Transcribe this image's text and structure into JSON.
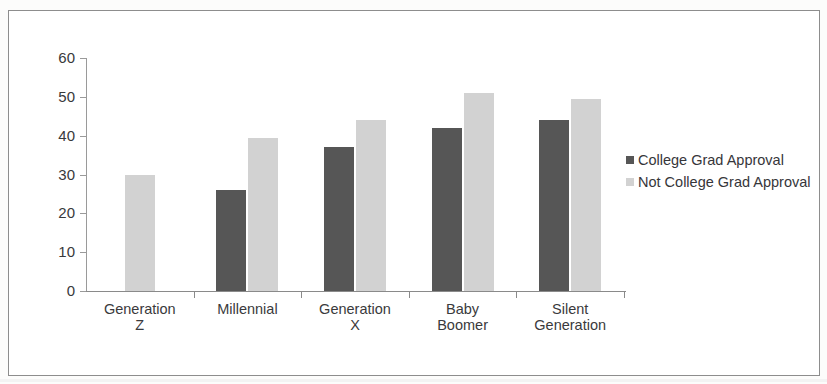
{
  "chart_data": {
    "type": "bar",
    "title": "",
    "subtitle": "",
    "xlabel": "",
    "ylabel": "",
    "ylim": [
      0,
      60
    ],
    "ytick_step": 10,
    "yticks": [
      60,
      50,
      40,
      30,
      20,
      10,
      0
    ],
    "grid": false,
    "legend_position": "right",
    "categories": [
      "Generation Z",
      "Millennial",
      "Generation X",
      "Baby Boomer",
      "Silent Generation"
    ],
    "category_lines": [
      [
        "Generation",
        "Z"
      ],
      [
        "Millennial",
        ""
      ],
      [
        "Generation",
        "X"
      ],
      [
        "Baby",
        "Boomer"
      ],
      [
        "Silent",
        "Generation"
      ]
    ],
    "series": [
      {
        "name": "College Grad Approval",
        "color": "#565656",
        "values": [
          null,
          26,
          37,
          42,
          44
        ]
      },
      {
        "name": "Not College Grad Approval",
        "color": "#d2d2d2",
        "values": [
          30,
          39.5,
          44,
          51,
          49.5
        ]
      }
    ]
  },
  "legend": {
    "items": [
      {
        "label": "College Grad Approval",
        "swatch": "legend-swatch-dark"
      },
      {
        "label": "Not College Grad Approval",
        "swatch": "legend-swatch-light"
      }
    ]
  }
}
